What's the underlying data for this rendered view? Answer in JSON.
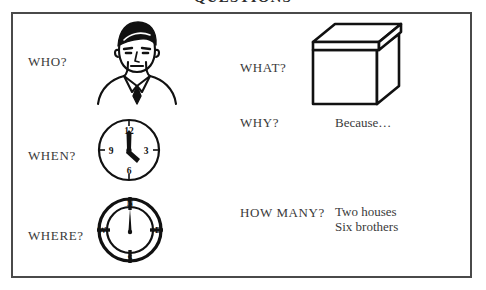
{
  "page": {
    "title": "QUESTIONS",
    "frame_color": "#4a4a4a",
    "ink_color": "#000000",
    "text_color": "#3a3a3a",
    "background": "#ffffff"
  },
  "left_column": [
    {
      "label": "WHO?",
      "illustration": "person-head-portrait"
    },
    {
      "label": "WHEN?",
      "illustration": "analog-clock"
    },
    {
      "label": "WHERE?",
      "illustration": "compass"
    }
  ],
  "right_column": [
    {
      "label": "WHAT?",
      "illustration": "cardboard-box",
      "answers": []
    },
    {
      "label": "WHY?",
      "illustration": "",
      "answers": [
        "Because…"
      ]
    },
    {
      "label": "HOW MANY?",
      "illustration": "",
      "answers": [
        "Two houses",
        "Six brothers"
      ]
    }
  ],
  "illustrations": {
    "clock": {
      "numerals": [
        "12",
        "3",
        "6",
        "9"
      ],
      "hour_hand_points_to": "4",
      "minute_hand_points_to": "12"
    },
    "compass": {
      "cardinal_points": [
        "N",
        "E",
        "S",
        "W"
      ],
      "needle_points_to": "N"
    },
    "box": {
      "description": "three-dimensional box with lid"
    },
    "person": {
      "description": "line drawing of a head and shoulders with collar and tie"
    }
  }
}
